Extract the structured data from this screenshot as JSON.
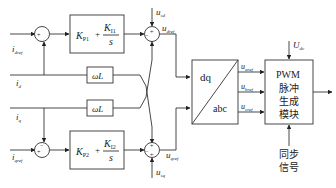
{
  "diagram": {
    "inputs": {
      "idref": "i",
      "idref_sub": "dref",
      "id": "i",
      "id_sub": "d",
      "iq": "i",
      "iq_sub": "q",
      "iqref": "i",
      "iqref_sub": "qref"
    },
    "pi_top": {
      "kp": "K",
      "kp_sub": "P1",
      "plus": "+",
      "ki": "K",
      "ki_sub": "I1",
      "s": "s"
    },
    "pi_bottom": {
      "kp": "K",
      "kp_sub": "P2",
      "plus": "+",
      "ki": "K",
      "ki_sub": "I2",
      "s": "s"
    },
    "omega_l_top": "ωL",
    "omega_l_bottom": "ωL",
    "feedforward": {
      "usd": "u",
      "usd_sub": "sd",
      "usq": "u",
      "usq_sub": "sq"
    },
    "outputs": {
      "udref": "u",
      "udref_sub": "dref",
      "uqref": "u",
      "uqref_sub": "qref"
    },
    "transform": {
      "top": "dq",
      "bottom": "abc"
    },
    "phase_refs": [
      {
        "u": "u",
        "sub": "aref"
      },
      {
        "u": "u",
        "sub": "bref"
      },
      {
        "u": "u",
        "sub": "cref"
      }
    ],
    "pwm": {
      "line1": "PWM",
      "line2": "脉冲",
      "line3": "生成",
      "line4": "模块",
      "udc": "U",
      "udc_sub": "dc"
    },
    "sync": {
      "line1": "同步",
      "line2": "信号"
    },
    "signs": {
      "sum1_plus": "+",
      "sum1_minus": "−",
      "sum2_plus": "+",
      "sum2_minus": "−",
      "sum3_plus": "+",
      "sum3_minus": "−",
      "sum4_plus": "+",
      "sum4_minus": "−",
      "sum4_plus2": "+"
    }
  }
}
